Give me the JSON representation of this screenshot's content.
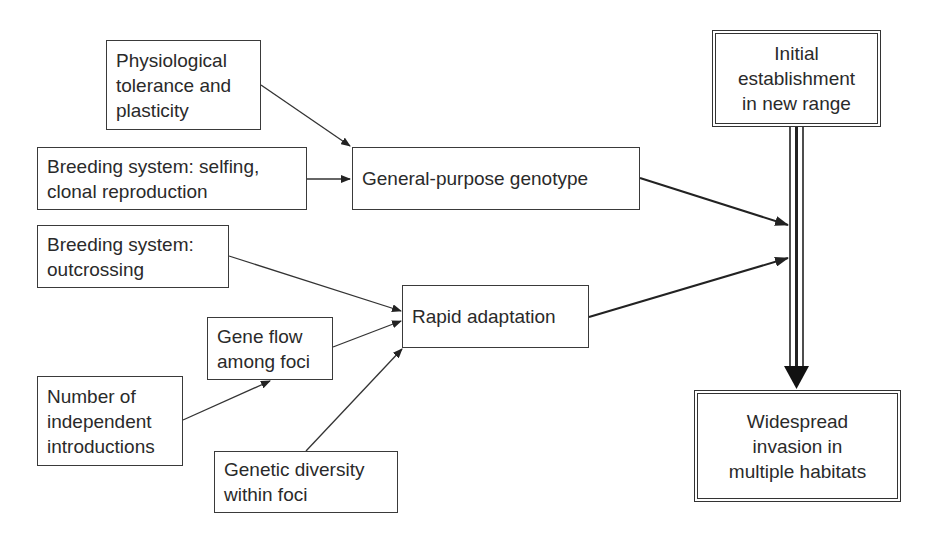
{
  "diagram": {
    "type": "flowchart",
    "nodes": {
      "physiological": {
        "label": "Physiological\ntolerance and\nplasticity"
      },
      "selfing": {
        "label": "Breeding system: selfing,\nclonal reproduction"
      },
      "general_purpose": {
        "label": "General-purpose genotype"
      },
      "outcrossing": {
        "label": "Breeding system:\noutcrossing"
      },
      "rapid_adaptation": {
        "label": "Rapid adaptation"
      },
      "gene_flow": {
        "label": "Gene flow\namong foci"
      },
      "introductions": {
        "label": "Number of\nindependent\nintroductions"
      },
      "genetic_diversity": {
        "label": "Genetic diversity\nwithin foci"
      },
      "initial_establishment": {
        "label": "Initial\nestablishment\nin new range"
      },
      "widespread_invasion": {
        "label": "Widespread\ninvasion in\nmultiple habitats"
      }
    },
    "edges": [
      {
        "from": "physiological",
        "to": "general_purpose"
      },
      {
        "from": "selfing",
        "to": "general_purpose"
      },
      {
        "from": "general_purpose",
        "to": "establishment_to_invasion_link"
      },
      {
        "from": "outcrossing",
        "to": "rapid_adaptation"
      },
      {
        "from": "gene_flow",
        "to": "rapid_adaptation"
      },
      {
        "from": "introductions",
        "to": "gene_flow"
      },
      {
        "from": "genetic_diversity",
        "to": "rapid_adaptation"
      },
      {
        "from": "rapid_adaptation",
        "to": "establishment_to_invasion_link"
      },
      {
        "from": "initial_establishment",
        "to": "widespread_invasion",
        "style": "triple-line"
      }
    ]
  }
}
